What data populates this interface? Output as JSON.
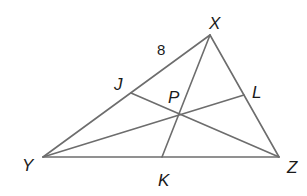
{
  "diagram": {
    "type": "triangle-with-cevians",
    "colors": {
      "line": "#6d6d6d",
      "text": "#1a1a1a",
      "background": "#ffffff"
    },
    "points": {
      "X": {
        "label": "X",
        "x": 210,
        "y": 35,
        "lx": 209,
        "ly": 29
      },
      "Y": {
        "label": "Y",
        "x": 43,
        "y": 157,
        "lx": 22,
        "ly": 171
      },
      "Z": {
        "label": "Z",
        "x": 279,
        "y": 157,
        "lx": 287,
        "ly": 173
      },
      "J": {
        "label": "J",
        "x": 131,
        "y": 93,
        "lx": 114,
        "ly": 90
      },
      "L": {
        "label": "L",
        "x": 244,
        "y": 95,
        "lx": 252,
        "ly": 98
      },
      "K": {
        "label": "K",
        "x": 162,
        "y": 157,
        "lx": 158,
        "ly": 186
      },
      "P": {
        "label": "P",
        "x": 180,
        "y": 115,
        "lx": 168,
        "ly": 103
      }
    },
    "segments": [
      {
        "name": "side-XY",
        "from": "X",
        "to": "Y"
      },
      {
        "name": "side-XZ",
        "from": "X",
        "to": "Z"
      },
      {
        "name": "side-YZ",
        "from": "Y",
        "to": "Z"
      },
      {
        "name": "cevian-XK",
        "from": "X",
        "to": "K"
      },
      {
        "name": "cevian-YL",
        "from": "Y",
        "to": "L"
      },
      {
        "name": "cevian-ZJ",
        "from": "Z",
        "to": "J"
      }
    ],
    "measurements": [
      {
        "segment": "XJ",
        "value": "8",
        "x": 157,
        "y": 55
      }
    ]
  }
}
